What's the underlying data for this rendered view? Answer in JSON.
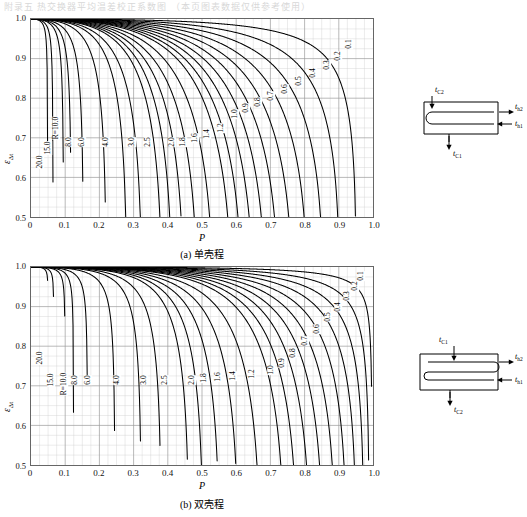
{
  "page": {
    "top_text": "附录五 热交换器平均温差校正系数图      （本页图表数据仅供参考使用）"
  },
  "chart_data": [
    {
      "id": "chart-a",
      "type": "line",
      "title": "(a) 单壳程",
      "caption": "(a) 单壳程",
      "xlabel": "P",
      "ylabel": "ε",
      "ylabel_sub": "Δt",
      "xlim": [
        0,
        1.0
      ],
      "ylim": [
        0.5,
        1.0
      ],
      "xticks": [
        "0",
        "0.1",
        "0.2",
        "0.3",
        "0.4",
        "0.5",
        "0.6",
        "0.7",
        "0.8",
        "0.9",
        "1.0"
      ],
      "yticks": [
        "0.5",
        "0.6",
        "0.7",
        "0.8",
        "0.9",
        "1.0"
      ],
      "grid": true,
      "minor_grid": true,
      "legend_position": "inline-curve-labels",
      "param_symbol": "R",
      "series": [
        {
          "name": "R=10.0",
          "R": 10.0,
          "label": "R=10.0",
          "label_x": 0.075,
          "label_y": 0.725
        },
        {
          "name": "15.0",
          "R": 15.0,
          "label": "15.0",
          "label_x": 0.052,
          "label_y": 0.675
        },
        {
          "name": "20.0",
          "R": 20.0,
          "label": "20.0",
          "label_x": 0.03,
          "label_y": 0.64
        },
        {
          "name": "8.0",
          "R": 8.0,
          "label": "8.0",
          "label_x": 0.112,
          "label_y": 0.69
        },
        {
          "name": "6.0",
          "R": 6.0,
          "label": "6.0",
          "label_x": 0.152,
          "label_y": 0.69
        },
        {
          "name": "4.0",
          "R": 4.0,
          "label": "4.0",
          "label_x": 0.222,
          "label_y": 0.69
        },
        {
          "name": "3.0",
          "R": 3.0,
          "label": "3.0",
          "label_x": 0.295,
          "label_y": 0.69
        },
        {
          "name": "2.5",
          "R": 2.5,
          "label": "2.5",
          "label_x": 0.342,
          "label_y": 0.69
        },
        {
          "name": "2.0",
          "R": 2.0,
          "label": "2.0",
          "label_x": 0.413,
          "label_y": 0.69
        },
        {
          "name": "1.8",
          "R": 1.8,
          "label": "1.8",
          "label_x": 0.446,
          "label_y": 0.69
        },
        {
          "name": "1.6",
          "R": 1.6,
          "label": "1.6",
          "label_x": 0.479,
          "label_y": 0.7
        },
        {
          "name": "1.4",
          "R": 1.4,
          "label": "1.4",
          "label_x": 0.515,
          "label_y": 0.71
        },
        {
          "name": "1.2",
          "R": 1.2,
          "label": "1.2",
          "label_x": 0.556,
          "label_y": 0.725
        },
        {
          "name": "1.0",
          "R": 1.0,
          "label": "1.0",
          "label_x": 0.596,
          "label_y": 0.76
        },
        {
          "name": "0.9",
          "R": 0.9,
          "label": "0.9",
          "label_x": 0.628,
          "label_y": 0.775
        },
        {
          "name": "0.8",
          "R": 0.8,
          "label": "0.8",
          "label_x": 0.663,
          "label_y": 0.79
        },
        {
          "name": "0.7",
          "R": 0.7,
          "label": "0.7",
          "label_x": 0.7,
          "label_y": 0.805
        },
        {
          "name": "0.6",
          "R": 0.6,
          "label": "0.6",
          "label_x": 0.74,
          "label_y": 0.822
        },
        {
          "name": "0.5",
          "R": 0.5,
          "label": "0.5",
          "label_x": 0.782,
          "label_y": 0.842
        },
        {
          "name": "0.4",
          "R": 0.4,
          "label": "0.4",
          "label_x": 0.822,
          "label_y": 0.862
        },
        {
          "name": "0.3",
          "R": 0.3,
          "label": "0.3",
          "label_x": 0.862,
          "label_y": 0.882
        },
        {
          "name": "0.2",
          "R": 0.2,
          "label": "0.2",
          "label_x": 0.895,
          "label_y": 0.905
        },
        {
          "name": "0.1",
          "R": 0.1,
          "label": "0.1",
          "label_x": 0.928,
          "label_y": 0.935
        }
      ],
      "diagram": {
        "name": "single-shell-pass-exchanger",
        "labels": [
          "t",
          "C2",
          "t",
          "h2",
          "t",
          "h1",
          "t",
          "C1"
        ],
        "label_tc_top": "t",
        "label_tc_top_sub": "C2",
        "label_th_out": "t",
        "label_th_out_sub": "h2",
        "label_th_in": "t",
        "label_th_in_sub": "h1",
        "label_tc_bot": "t",
        "label_tc_bot_sub": "C1"
      }
    },
    {
      "id": "chart-b",
      "type": "line",
      "title": "(b) 双壳程",
      "caption": "(b) 双壳程",
      "xlabel": "P",
      "ylabel": "ε",
      "ylabel_sub": "Δt",
      "xlim": [
        0,
        1.0
      ],
      "ylim": [
        0.5,
        1.0
      ],
      "xticks": [
        "0",
        "0.1",
        "0.2",
        "0.3",
        "0.4",
        "0.5",
        "0.6",
        "0.7",
        "0.8",
        "0.9",
        "1.0"
      ],
      "yticks": [
        "0.5",
        "0.6",
        "0.7",
        "0.8",
        "0.9",
        "1.0"
      ],
      "grid": true,
      "minor_grid": true,
      "legend_position": "inline-curve-labels",
      "param_symbol": "R",
      "series": [
        {
          "name": "20.0",
          "R": 20.0,
          "label": "20.0",
          "label_x": 0.03,
          "label_y": 0.77
        },
        {
          "name": "15.0",
          "R": 15.0,
          "label": "15.0",
          "label_x": 0.062,
          "label_y": 0.715
        },
        {
          "name": "R=10.0",
          "R": 10.0,
          "label": "R=10.0",
          "label_x": 0.1,
          "label_y": 0.705
        },
        {
          "name": "8.0",
          "R": 8.0,
          "label": "8.0",
          "label_x": 0.132,
          "label_y": 0.715
        },
        {
          "name": "6.0",
          "R": 6.0,
          "label": "6.0",
          "label_x": 0.168,
          "label_y": 0.715
        },
        {
          "name": "4.0",
          "R": 4.0,
          "label": "4.0",
          "label_x": 0.252,
          "label_y": 0.715
        },
        {
          "name": "3.0",
          "R": 3.0,
          "label": "3.0",
          "label_x": 0.33,
          "label_y": 0.715
        },
        {
          "name": "2.5",
          "R": 2.5,
          "label": "2.5",
          "label_x": 0.392,
          "label_y": 0.715
        },
        {
          "name": "2.0",
          "R": 2.0,
          "label": "2.0",
          "label_x": 0.47,
          "label_y": 0.715
        },
        {
          "name": "1.8",
          "R": 1.8,
          "label": "1.8",
          "label_x": 0.505,
          "label_y": 0.72
        },
        {
          "name": "1.6",
          "R": 1.6,
          "label": "1.6",
          "label_x": 0.545,
          "label_y": 0.722
        },
        {
          "name": "1.4",
          "R": 1.4,
          "label": "1.4",
          "label_x": 0.59,
          "label_y": 0.726
        },
        {
          "name": "1.2",
          "R": 1.2,
          "label": "1.2",
          "label_x": 0.645,
          "label_y": 0.73
        },
        {
          "name": "1.0",
          "R": 1.0,
          "label": "1.0",
          "label_x": 0.7,
          "label_y": 0.74
        },
        {
          "name": "0.9",
          "R": 0.9,
          "label": "0.9",
          "label_x": 0.733,
          "label_y": 0.757
        },
        {
          "name": "0.8",
          "R": 0.8,
          "label": "0.8",
          "label_x": 0.765,
          "label_y": 0.782
        },
        {
          "name": "0.7",
          "R": 0.7,
          "label": "0.7",
          "label_x": 0.8,
          "label_y": 0.812
        },
        {
          "name": "0.6",
          "R": 0.6,
          "label": "0.6",
          "label_x": 0.833,
          "label_y": 0.842
        },
        {
          "name": "0.5",
          "R": 0.5,
          "label": "0.5",
          "label_x": 0.866,
          "label_y": 0.872
        },
        {
          "name": "0.4",
          "R": 0.4,
          "label": "0.4",
          "label_x": 0.895,
          "label_y": 0.898
        },
        {
          "name": "0.3",
          "R": 0.3,
          "label": "0.3",
          "label_x": 0.922,
          "label_y": 0.925
        },
        {
          "name": "0.2",
          "R": 0.2,
          "label": "0.2",
          "label_x": 0.944,
          "label_y": 0.95
        },
        {
          "name": "0.1",
          "R": 0.1,
          "label": "0.1",
          "label_x": 0.963,
          "label_y": 0.975
        }
      ],
      "diagram": {
        "name": "double-shell-pass-exchanger",
        "labels": [
          "t",
          "C1",
          "t",
          "h2",
          "t",
          "h1",
          "t",
          "C2"
        ],
        "label_tc_top": "t",
        "label_tc_top_sub": "C1",
        "label_th_out": "t",
        "label_th_out_sub": "h2",
        "label_th_in": "t",
        "label_th_in_sub": "h1",
        "label_tc_bot": "t",
        "label_tc_bot_sub": "C2"
      }
    }
  ]
}
